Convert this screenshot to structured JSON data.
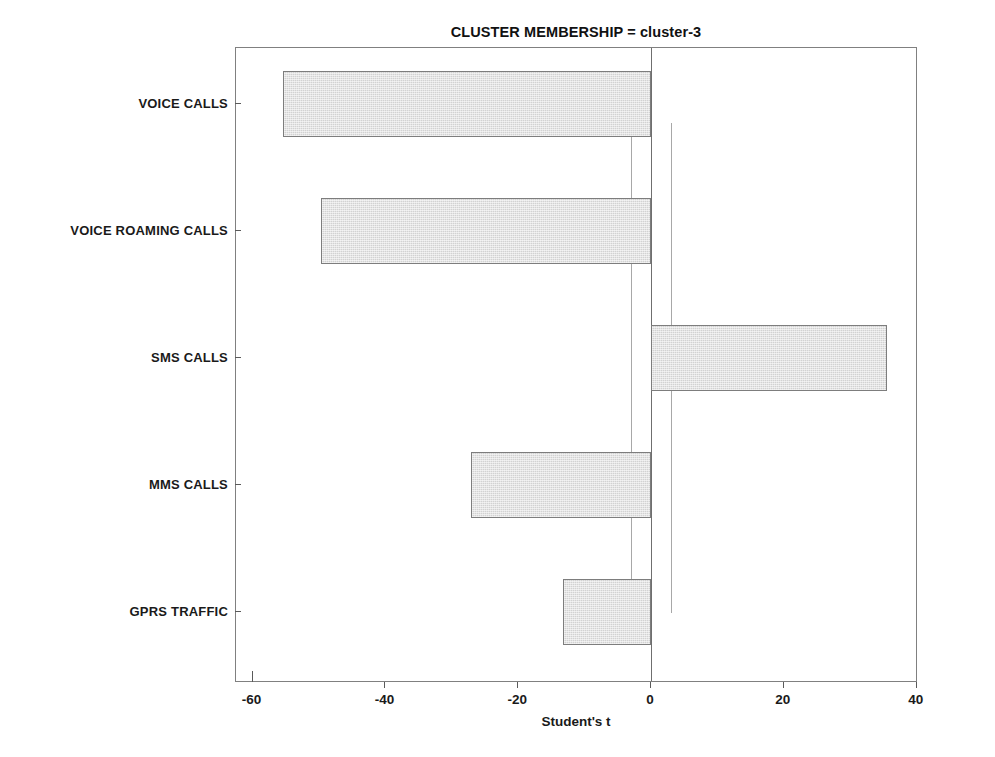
{
  "chart_data": {
    "type": "bar",
    "orientation": "horizontal",
    "title": "CLUSTER MEMBERSHIP = cluster-3",
    "xlabel": "Student's t",
    "ylabel": "",
    "categories": [
      "VOICE CALLS",
      "VOICE ROAMING CALLS",
      "SMS CALLS",
      "MMS CALLS",
      "GPRS TRAFFIC"
    ],
    "values": [
      -55.4,
      -49.7,
      35.5,
      -27.1,
      -13.3
    ],
    "xlim": [
      -62.5,
      40.2
    ],
    "ylim": [
      0,
      5
    ],
    "xticks": [
      -60,
      -40,
      -20,
      0,
      20,
      40
    ],
    "xticklabels": [
      "-60",
      "-40",
      "-20",
      "0",
      "20",
      "40"
    ],
    "grid": false,
    "legend": null,
    "reference_lines": {
      "zero": 0,
      "critical": [
        -3.0,
        3.0
      ]
    },
    "colors": {
      "bar_fill": "#d2d2d2",
      "bar_edge": "#7d7d7d",
      "frame": "#808080",
      "zero_line": "#6f6f6f",
      "reference_line": "#a8a8a8",
      "text": "#1a1a1a",
      "background": "#ffffff"
    }
  }
}
